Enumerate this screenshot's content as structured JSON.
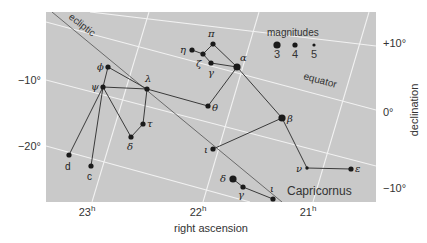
{
  "chart_data": {
    "type": "scatter",
    "title": "",
    "subtitle": "Star chart of Aquarius and Capricornus region",
    "xlabel": "right ascension",
    "ylabel": "declination",
    "x_ticks": [
      {
        "label": "23",
        "sup": "h",
        "x": 92
      },
      {
        "label": "22",
        "sup": "h",
        "x": 203
      },
      {
        "label": "21",
        "sup": "h",
        "x": 313
      }
    ],
    "y_ticks_left": [
      {
        "label": "−10°",
        "y": 80
      },
      {
        "label": "−20°",
        "y": 146
      }
    ],
    "y_ticks_right": [
      {
        "label": "+10°",
        "y": 43
      },
      {
        "label": "0°",
        "y": 112
      },
      {
        "label": "−10°",
        "y": 188
      }
    ],
    "xlim_hours": [
      23.4,
      20.6
    ],
    "ylim_deg": [
      -27,
      15
    ],
    "grid": true,
    "grid_lines": {
      "ra": [
        {
          "name": "23h",
          "x1": 149,
          "y1": 12,
          "x2": 92,
          "y2": 202
        },
        {
          "name": "22h",
          "x1": 259,
          "y1": 12,
          "x2": 203,
          "y2": 202
        },
        {
          "name": "21h",
          "x1": 369,
          "y1": 12,
          "x2": 313,
          "y2": 202
        }
      ],
      "dec": [
        {
          "name": "+10deg",
          "x1": 90,
          "y1": 12,
          "x2": 376,
          "y2": 46
        },
        {
          "name": "0deg",
          "x1": 46,
          "y1": 22,
          "x2": 376,
          "y2": 110
        },
        {
          "name": "-10deg",
          "x1": 46,
          "y1": 80,
          "x2": 376,
          "y2": 166
        },
        {
          "name": "-20deg",
          "x1": 46,
          "y1": 146,
          "x2": 250,
          "y2": 202
        }
      ]
    },
    "ecliptic": {
      "label": "ecliptic",
      "x1": 52,
      "y1": 12,
      "x2": 282,
      "y2": 202
    },
    "equator_label": "equator",
    "constellation_label": "Capricornus",
    "legend": {
      "title": "magnitudes",
      "position": "top-right",
      "entries": [
        {
          "magnitude": "3",
          "radius": 3.6
        },
        {
          "magnitude": "4",
          "radius": 2.6
        },
        {
          "magnitude": "5",
          "radius": 1.6
        }
      ]
    },
    "stars": [
      {
        "id": "phi",
        "label": "ϕ",
        "constellation": "Aquarius",
        "x": 108,
        "y": 67,
        "mag": 4,
        "lx": 97,
        "ly": 70
      },
      {
        "id": "psi",
        "label": "ψ",
        "constellation": "Aquarius",
        "x": 103,
        "y": 87,
        "mag": 4,
        "lx": 91,
        "ly": 90
      },
      {
        "id": "lambda",
        "label": "λ",
        "constellation": "Aquarius",
        "x": 147,
        "y": 89,
        "mag": 4,
        "lx": 145,
        "ly": 82
      },
      {
        "id": "tau",
        "label": "τ",
        "constellation": "Aquarius",
        "x": 143,
        "y": 124,
        "mag": 4,
        "lx": 147,
        "ly": 127
      },
      {
        "id": "delta",
        "label": "δ",
        "constellation": "Aquarius",
        "x": 131,
        "y": 137,
        "mag": 4,
        "lx": 127,
        "ly": 150
      },
      {
        "id": "d",
        "label": "d",
        "constellation": "Aquarius",
        "x": 69,
        "y": 155,
        "mag": 4,
        "lx": 65,
        "ly": 170
      },
      {
        "id": "c",
        "label": "c",
        "constellation": "Aquarius",
        "x": 91,
        "y": 166,
        "mag": 4,
        "lx": 87,
        "ly": 180
      },
      {
        "id": "eta",
        "label": "η",
        "constellation": "Aquarius",
        "x": 192,
        "y": 50,
        "mag": 4,
        "lx": 180,
        "ly": 53
      },
      {
        "id": "zeta",
        "label": "ζ",
        "constellation": "Aquarius",
        "x": 203,
        "y": 54,
        "mag": 4,
        "lx": 196,
        "ly": 67
      },
      {
        "id": "pi",
        "label": "π",
        "constellation": "Aquarius",
        "x": 213,
        "y": 44,
        "mag": 4,
        "lx": 208,
        "ly": 37
      },
      {
        "id": "gamma",
        "label": "γ",
        "constellation": "Aquarius",
        "x": 211,
        "y": 63,
        "mag": 4,
        "lx": 208,
        "ly": 76
      },
      {
        "id": "alpha",
        "label": "α",
        "constellation": "Aquarius",
        "x": 237,
        "y": 67,
        "mag": 3,
        "lx": 240,
        "ly": 61
      },
      {
        "id": "theta",
        "label": "θ",
        "constellation": "Aquarius",
        "x": 208,
        "y": 106,
        "mag": 4,
        "lx": 212,
        "ly": 111
      },
      {
        "id": "beta",
        "label": "β",
        "constellation": "Aquarius",
        "x": 282,
        "y": 118,
        "mag": 3,
        "lx": 287,
        "ly": 122
      },
      {
        "id": "iota",
        "label": "ι",
        "constellation": "Aquarius",
        "x": 213,
        "y": 149,
        "mag": 4,
        "lx": 204,
        "ly": 153
      },
      {
        "id": "nu",
        "label": "ν",
        "constellation": "Aquarius",
        "x": 307,
        "y": 168,
        "mag": 5,
        "lx": 296,
        "ly": 172
      },
      {
        "id": "epsilon",
        "label": "ε",
        "constellation": "Aquarius",
        "x": 351,
        "y": 169,
        "mag": 4,
        "lx": 355,
        "ly": 172
      },
      {
        "id": "delta_cap",
        "label": "δ",
        "constellation": "Capricornus",
        "x": 233,
        "y": 179,
        "mag": 3,
        "lx": 220,
        "ly": 182
      },
      {
        "id": "gamma_cap",
        "label": "γ",
        "constellation": "Capricornus",
        "x": 243,
        "y": 187,
        "mag": 4,
        "lx": 238,
        "ly": 198
      },
      {
        "id": "iota_cap",
        "label": "ι",
        "constellation": "Capricornus",
        "x": 273,
        "y": 199,
        "mag": 4,
        "lx": 270,
        "ly": 192
      }
    ],
    "lines": [
      [
        "phi",
        "psi"
      ],
      [
        "phi",
        "lambda"
      ],
      [
        "lambda",
        "theta"
      ],
      [
        "psi",
        "lambda"
      ],
      [
        "lambda",
        "tau"
      ],
      [
        "tau",
        "delta"
      ],
      [
        "delta",
        "psi"
      ],
      [
        "psi",
        "d"
      ],
      [
        "psi",
        "c"
      ],
      [
        "eta",
        "zeta"
      ],
      [
        "zeta",
        "pi"
      ],
      [
        "pi",
        "alpha"
      ],
      [
        "gamma",
        "alpha"
      ],
      [
        "zeta",
        "gamma"
      ],
      [
        "theta",
        "alpha"
      ],
      [
        "alpha",
        "beta"
      ],
      [
        "beta",
        "iota"
      ],
      [
        "beta",
        "nu"
      ],
      [
        "nu",
        "epsilon"
      ],
      [
        "gamma_cap",
        "iota_cap"
      ],
      [
        "delta_cap",
        "gamma_cap"
      ]
    ]
  },
  "labels": {
    "xlabel": "right ascension",
    "ylabel": "declination",
    "ecliptic": "ecliptic",
    "equator": "equator",
    "constellation": "Capricornus",
    "legend_title": "magnitudes"
  }
}
